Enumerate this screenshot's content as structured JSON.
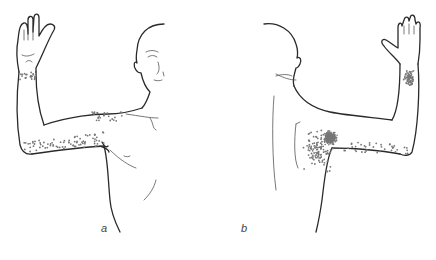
{
  "figure": {
    "panels": [
      {
        "id": "a",
        "label": "a",
        "view": "anterior",
        "label_pos": {
          "x": 101,
          "y": 222
        }
      },
      {
        "id": "b",
        "label": "b",
        "view": "posterior",
        "label_pos": {
          "x": 241,
          "y": 222
        }
      }
    ],
    "colors": {
      "line": "#2a2a2a",
      "dots": "#777777",
      "background": "#ffffff"
    }
  }
}
